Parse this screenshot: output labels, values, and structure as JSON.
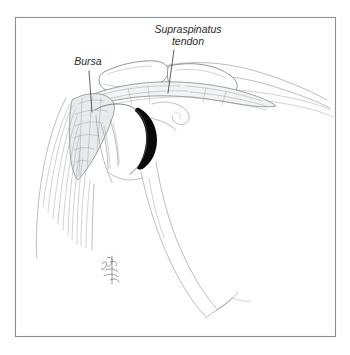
{
  "figure": {
    "kind": "anatomical-line-illustration",
    "background_color": "#ffffff",
    "border_color": "#8c8f93",
    "ink_color": "#55585c",
    "accent_dark_color": "#0a0a0a",
    "bursa_shade_color": "#e9eaec",
    "frame": {
      "x": 15,
      "y": 17,
      "width": 321,
      "height": 320
    },
    "labels": [
      {
        "id": "supraspinatus",
        "line1": "Supraspinatus",
        "line2": "tendon",
        "style": "italic",
        "x": 188,
        "y1": 33,
        "y2": 45,
        "anchor": "middle",
        "leader": {
          "x1": 174,
          "y1": 50,
          "x2": 168,
          "y2": 92
        }
      },
      {
        "id": "bursa",
        "line1": "Bursa",
        "line2": "",
        "style": "italic",
        "x": 88,
        "y1": 65,
        "y2": 65,
        "anchor": "middle",
        "leader": {
          "x1": 89,
          "y1": 71,
          "x2": 92,
          "y2": 112
        }
      }
    ],
    "signature": {
      "present": true,
      "description": "artist cursive signature",
      "x": 107,
      "y": 272
    }
  }
}
